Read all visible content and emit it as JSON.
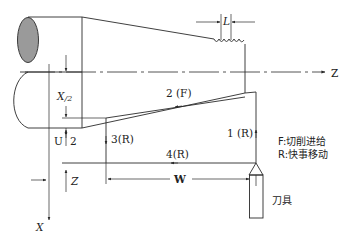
{
  "diagram": {
    "title": "",
    "colors": {
      "line": "#2a2a2a",
      "workpiece_end_fill": "#9a9a9a",
      "background": "#ffffff"
    },
    "axes": {
      "z_label": "Z",
      "x_label": "X",
      "z_increment_label": "Z",
      "u_label": "U",
      "u_divisor": "2",
      "x_half_label": "X/2",
      "x_half_main": "X",
      "x_half_sub": "/2"
    },
    "dimensions": {
      "pitch_label": "L",
      "length_label": "W"
    },
    "tool_path": [
      {
        "step": "1",
        "label": "1 (R)",
        "type": "R"
      },
      {
        "step": "2",
        "label": "2 (F)",
        "type": "F"
      },
      {
        "step": "3",
        "label": "3(R)",
        "type": "R"
      },
      {
        "step": "4",
        "label": "4(R)",
        "type": "R"
      }
    ],
    "legend": [
      {
        "key": "F",
        "text": "F:切削进给"
      },
      {
        "key": "R",
        "text": "R:快事移动"
      }
    ],
    "tool_label": "刀具"
  }
}
